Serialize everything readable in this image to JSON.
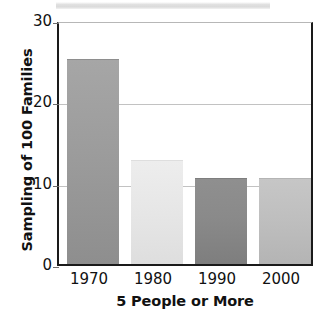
{
  "chart_data": {
    "type": "bar",
    "title": "",
    "subtitle": "",
    "xlabel": "5 People or More",
    "ylabel": "Sampling of 100 Families",
    "categories": [
      "1970",
      "1980",
      "1990",
      "2000"
    ],
    "values": [
      25.1,
      12.7,
      10.4,
      10.5
    ],
    "series": [
      {
        "name": "5 People or More",
        "values": [
          25.1,
          12.7,
          10.4,
          10.5
        ]
      }
    ],
    "ylim": [
      0,
      30
    ],
    "yticks": [
      0,
      10,
      20,
      30
    ],
    "ytick_labels": [
      "0",
      "10",
      "20",
      "30"
    ],
    "xtick_labels": [
      "1970",
      "1980",
      "1990",
      "2000"
    ],
    "grid": true,
    "grid_axis": "y",
    "legend": false,
    "legend_position": "none",
    "annotations": [],
    "bar_colors": [
      "#9a9a9a",
      "#e6e6e6",
      "#8a8a8a",
      "#bdbdbd"
    ],
    "bar_gradients": [
      {
        "top": "#a6a6a6",
        "mid": "#9c9c9c",
        "bottom": "#8e8e8e"
      },
      {
        "top": "#ededed",
        "mid": "#e7e7e7",
        "bottom": "#dedede"
      },
      {
        "top": "#8f8f8f",
        "mid": "#8a8a8a",
        "bottom": "#7e7e7e"
      },
      {
        "top": "#c6c6c6",
        "mid": "#bfbfbf",
        "bottom": "#b4b4b4"
      }
    ]
  },
  "axes": {
    "frame_color": "#1a1a1a",
    "gridline_color": "#c2c2c2",
    "tick_color": "#6d6d6d",
    "text_color": "#111111",
    "background": "#ffffff"
  },
  "artifact": {
    "name": "scan-artifact-band",
    "color": "#dcdcdc"
  }
}
